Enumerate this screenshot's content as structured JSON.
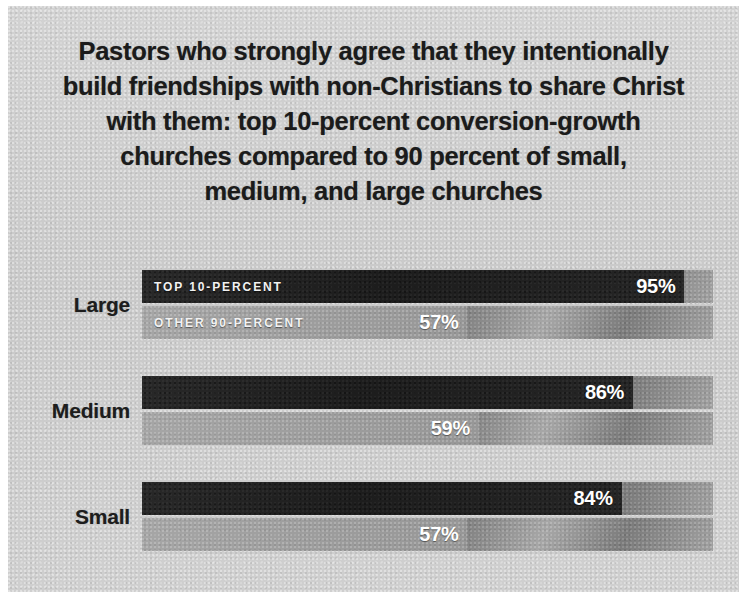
{
  "chart_data": {
    "type": "bar",
    "orientation": "horizontal",
    "title_lines": [
      "Pastors who strongly agree that they intentionally",
      "build friendships with non-Christians to share Christ",
      "with them: top 10-percent conversion-growth",
      "churches compared to 90 percent of small,",
      "medium, and large churches"
    ],
    "categories": [
      "Large",
      "Medium",
      "Small"
    ],
    "series": [
      {
        "name": "TOP 10-PERCENT",
        "values": [
          95,
          86,
          84
        ],
        "labels": [
          "95%",
          "86%",
          "84%"
        ],
        "color": "#1d1d1d"
      },
      {
        "name": "OTHER 90-PERCENT",
        "values": [
          57,
          59,
          57
        ],
        "labels": [
          "57%",
          "59%",
          "57%"
        ],
        "color": "#9c9c9c"
      }
    ],
    "xlabel": "",
    "ylabel": "",
    "xlim": [
      0,
      100
    ],
    "unit": "%",
    "grid": false,
    "axis_visible": false,
    "legend": {
      "position": "in-bar-first-group",
      "entries": [
        "TOP 10-PERCENT",
        "OTHER 90-PERCENT"
      ]
    },
    "groups": [
      {
        "category": "Large",
        "bars": [
          {
            "series": "TOP 10-PERCENT",
            "value": 95,
            "label": "95%",
            "legend": "TOP 10-PERCENT"
          },
          {
            "series": "OTHER 90-PERCENT",
            "value": 57,
            "label": "57%",
            "legend": "OTHER 90-PERCENT"
          }
        ]
      },
      {
        "category": "Medium",
        "bars": [
          {
            "series": "TOP 10-PERCENT",
            "value": 86,
            "label": "86%",
            "legend": ""
          },
          {
            "series": "OTHER 90-PERCENT",
            "value": 59,
            "label": "59%",
            "legend": ""
          }
        ]
      },
      {
        "category": "Small",
        "bars": [
          {
            "series": "TOP 10-PERCENT",
            "value": 84,
            "label": "84%",
            "legend": ""
          },
          {
            "series": "OTHER 90-PERCENT",
            "value": 57,
            "label": "57%",
            "legend": ""
          }
        ]
      }
    ]
  },
  "colors": {
    "panel_background": "#cccccc",
    "frame": "#ffffff",
    "title_text": "#1b1b1b",
    "category_text": "#1d1d1d",
    "series_top": "#1d1d1d",
    "series_other": "#9c9c9c",
    "track": "#8e8e8e",
    "value_text": "#ffffff"
  }
}
